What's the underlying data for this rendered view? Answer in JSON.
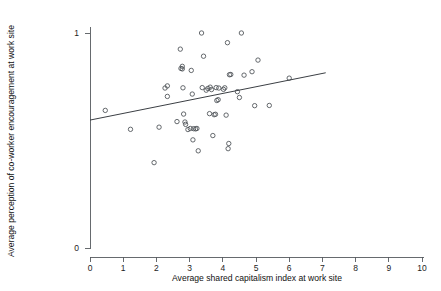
{
  "chart_data": {
    "type": "scatter",
    "title": "",
    "xlabel": "Average shared capitalism index at work site",
    "ylabel": "Average perception of co-worker encouragement at work site",
    "xlim": [
      0,
      10
    ],
    "ylim": [
      0,
      1
    ],
    "xticks": [
      0,
      1,
      2,
      3,
      4,
      5,
      6,
      7,
      8,
      9,
      10
    ],
    "xticklabels": [
      "0",
      "1",
      "2",
      "3",
      "4",
      "5",
      "6",
      "7",
      "8",
      "9",
      "10"
    ],
    "yticks": [
      0,
      1
    ],
    "yticklabels": [
      "0",
      "1"
    ],
    "grid": false,
    "legend": null,
    "marker": "open-circle",
    "marker_color": "#4a4f54",
    "line_color": "#3b3f44",
    "fit_line": {
      "type": "linear-fit",
      "x_start": 0.0,
      "y_start": 0.595,
      "x_end": 7.1,
      "y_end": 0.815
    },
    "points": [
      {
        "x": 0.46,
        "y": 0.64
      },
      {
        "x": 1.22,
        "y": 0.552
      },
      {
        "x": 1.93,
        "y": 0.397
      },
      {
        "x": 2.08,
        "y": 0.562
      },
      {
        "x": 2.26,
        "y": 0.744
      },
      {
        "x": 2.33,
        "y": 0.754
      },
      {
        "x": 2.33,
        "y": 0.705
      },
      {
        "x": 2.62,
        "y": 0.588
      },
      {
        "x": 2.72,
        "y": 0.925
      },
      {
        "x": 2.74,
        "y": 0.835
      },
      {
        "x": 2.78,
        "y": 0.833
      },
      {
        "x": 2.78,
        "y": 0.845
      },
      {
        "x": 2.8,
        "y": 0.745
      },
      {
        "x": 2.82,
        "y": 0.623
      },
      {
        "x": 2.86,
        "y": 0.586
      },
      {
        "x": 2.88,
        "y": 0.575
      },
      {
        "x": 2.95,
        "y": 0.551
      },
      {
        "x": 3.02,
        "y": 0.556
      },
      {
        "x": 3.05,
        "y": 0.826
      },
      {
        "x": 3.08,
        "y": 0.716
      },
      {
        "x": 3.1,
        "y": 0.503
      },
      {
        "x": 3.12,
        "y": 0.555
      },
      {
        "x": 3.18,
        "y": 0.554
      },
      {
        "x": 3.22,
        "y": 0.556
      },
      {
        "x": 3.26,
        "y": 0.452
      },
      {
        "x": 3.36,
        "y": 1.0
      },
      {
        "x": 3.38,
        "y": 0.746
      },
      {
        "x": 3.42,
        "y": 0.892
      },
      {
        "x": 3.5,
        "y": 0.734
      },
      {
        "x": 3.55,
        "y": 0.742
      },
      {
        "x": 3.6,
        "y": 0.625
      },
      {
        "x": 3.62,
        "y": 0.748
      },
      {
        "x": 3.66,
        "y": 0.737
      },
      {
        "x": 3.7,
        "y": 0.523
      },
      {
        "x": 3.74,
        "y": 0.62
      },
      {
        "x": 3.78,
        "y": 0.622
      },
      {
        "x": 3.8,
        "y": 0.746
      },
      {
        "x": 3.82,
        "y": 0.686
      },
      {
        "x": 3.86,
        "y": 0.69
      },
      {
        "x": 3.88,
        "y": 0.744
      },
      {
        "x": 4.02,
        "y": 0.738
      },
      {
        "x": 4.06,
        "y": 0.745
      },
      {
        "x": 4.1,
        "y": 0.618
      },
      {
        "x": 4.14,
        "y": 0.955
      },
      {
        "x": 4.16,
        "y": 0.462
      },
      {
        "x": 4.18,
        "y": 0.486
      },
      {
        "x": 4.2,
        "y": 0.806
      },
      {
        "x": 4.24,
        "y": 0.807
      },
      {
        "x": 4.44,
        "y": 0.727
      },
      {
        "x": 4.5,
        "y": 0.7
      },
      {
        "x": 4.56,
        "y": 1.0
      },
      {
        "x": 4.64,
        "y": 0.804
      },
      {
        "x": 4.88,
        "y": 0.82
      },
      {
        "x": 4.96,
        "y": 0.662
      },
      {
        "x": 5.06,
        "y": 0.874
      },
      {
        "x": 5.4,
        "y": 0.663
      },
      {
        "x": 6.0,
        "y": 0.79
      }
    ]
  }
}
